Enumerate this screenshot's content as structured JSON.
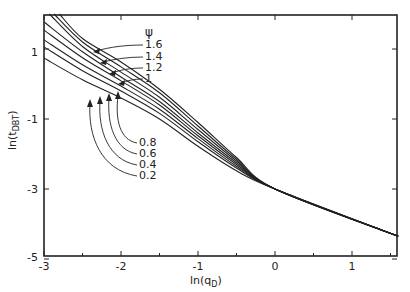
{
  "chart_data": {
    "type": "line",
    "title": "",
    "xlabel": "ln(q_D)",
    "ylabel": "ln(t_DBT)",
    "xlim": [
      -3,
      1.6
    ],
    "ylim": [
      -5,
      2
    ],
    "xticks": [
      -3,
      -2,
      -1,
      0,
      1
    ],
    "yticks": [
      -5,
      -3,
      -1,
      1
    ],
    "grid": false,
    "legend_title": "ψ",
    "series": [
      {
        "name": "1.6",
        "x": [
          -2.8,
          -2.5,
          -2,
          -1.5,
          -1,
          -0.5,
          0,
          1.6
        ],
        "y": [
          2.0,
          1.3,
          0.63,
          -0.15,
          -1.1,
          -2.1,
          -3.0,
          -4.35
        ]
      },
      {
        "name": "1.4",
        "x": [
          -2.87,
          -2.5,
          -2,
          -1.5,
          -1,
          -0.5,
          0,
          1.6
        ],
        "y": [
          2.0,
          1.2,
          0.49,
          -0.25,
          -1.2,
          -2.15,
          -3.0,
          -4.35
        ]
      },
      {
        "name": "1.2",
        "x": [
          -2.93,
          -2.5,
          -2,
          -1.5,
          -1,
          -0.5,
          0,
          1.6
        ],
        "y": [
          2.0,
          1.07,
          0.34,
          -0.38,
          -1.3,
          -2.2,
          -3.0,
          -4.35
        ]
      },
      {
        "name": "1",
        "x": [
          -3,
          -2.5,
          -2,
          -1.5,
          -1,
          -0.5,
          0,
          1.6
        ],
        "y": [
          1.77,
          0.92,
          0.2,
          -0.5,
          -1.4,
          -2.25,
          -3.0,
          -4.35
        ]
      },
      {
        "name": "0.8",
        "x": [
          -3,
          -2.5,
          -2,
          -1.5,
          -1,
          -0.5,
          0,
          1.6
        ],
        "y": [
          1.54,
          0.75,
          0.09,
          -0.6,
          -1.48,
          -2.3,
          -3.0,
          -4.35
        ]
      },
      {
        "name": "0.6",
        "x": [
          -3,
          -2.5,
          -2,
          -1.5,
          -1,
          -0.5,
          0,
          1.6
        ],
        "y": [
          1.26,
          0.55,
          -0.06,
          -0.72,
          -1.56,
          -2.35,
          -3.0,
          -4.35
        ]
      },
      {
        "name": "0.4",
        "x": [
          -3,
          -2.5,
          -2,
          -1.5,
          -1,
          -0.5,
          0,
          1.6
        ],
        "y": [
          1.06,
          0.38,
          -0.2,
          -0.84,
          -1.65,
          -2.4,
          -3.0,
          -4.35
        ]
      },
      {
        "name": "0.2",
        "x": [
          -3,
          -2.5,
          -2,
          -1.5,
          -1,
          -0.5,
          0,
          1.6
        ],
        "y": [
          0.74,
          0.12,
          -0.4,
          -1.0,
          -1.78,
          -2.48,
          -3.0,
          -4.35
        ]
      }
    ],
    "annotations": [
      {
        "text": "ψ",
        "role": "legend-title"
      },
      {
        "text": "1.6"
      },
      {
        "text": "1.4"
      },
      {
        "text": "1.2"
      },
      {
        "text": "1"
      },
      {
        "text": "0.8"
      },
      {
        "text": "0.6"
      },
      {
        "text": "0.4"
      },
      {
        "text": "0.2"
      }
    ]
  },
  "labels": {
    "xlabel_main": "ln(q",
    "xlabel_sub": "D",
    "xlabel_close": ")",
    "ylabel_main": "ln(t",
    "ylabel_sub": "DBT",
    "ylabel_close": ")",
    "psi": "ψ",
    "xtick_labels": [
      "-3",
      "-2",
      "-1",
      "0",
      "1"
    ],
    "ytick_labels": [
      "-5",
      "-3",
      "-1",
      "1"
    ],
    "upper_curve_labels": [
      "1.6",
      "1.4",
      "1.2",
      "1"
    ],
    "lower_curve_labels": [
      "0.8",
      "0.6",
      "0.4",
      "0.2"
    ]
  }
}
